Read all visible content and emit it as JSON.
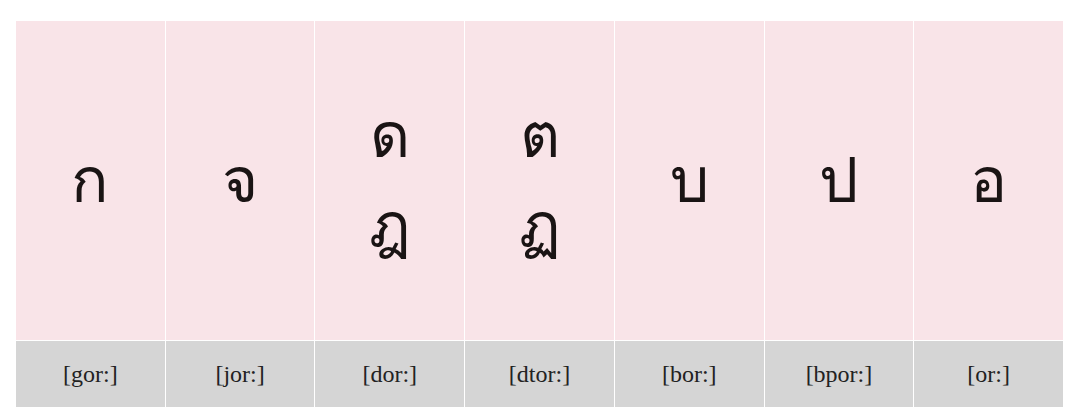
{
  "colors": {
    "glyph_bg": "#f9e4e8",
    "label_bg": "#d5d5d5",
    "text": "#1a1414"
  },
  "columns": [
    {
      "glyphs": [
        "ก"
      ],
      "label": "[gor:]"
    },
    {
      "glyphs": [
        "จ"
      ],
      "label": "[jor:]"
    },
    {
      "glyphs": [
        "ด",
        "ฎ"
      ],
      "label": "[dor:]"
    },
    {
      "glyphs": [
        "ต",
        "ฏ"
      ],
      "label": "[dtor:]"
    },
    {
      "glyphs": [
        "บ"
      ],
      "label": "[bor:]"
    },
    {
      "glyphs": [
        "ป"
      ],
      "label": "[bpor:]"
    },
    {
      "glyphs": [
        "อ"
      ],
      "label": "[or:]"
    }
  ]
}
